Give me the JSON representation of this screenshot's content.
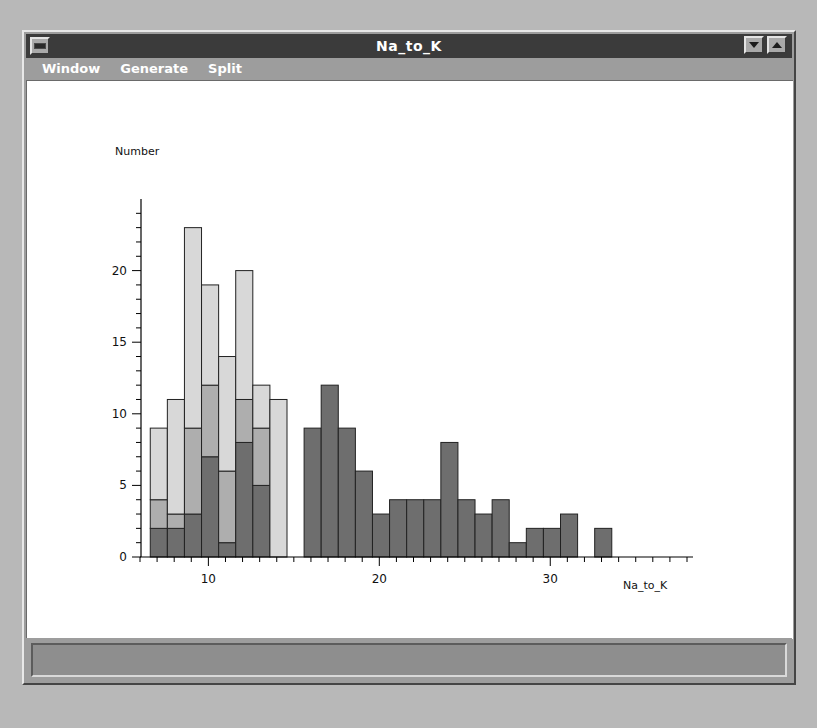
{
  "window": {
    "title": "Na_to_K",
    "controls": {
      "system_menu": "window-menu",
      "minimize": "minimize",
      "maximize": "maximize"
    },
    "menus": [
      "Window",
      "Generate",
      "Split"
    ]
  },
  "colors": {
    "drugB": "#d8d8d8",
    "drugC": "#aeaeae",
    "drugX": "#6e6e6e",
    "outline": "#222222",
    "titlebar": "#3b3b3b",
    "frame": "#9d9d9d",
    "plot_bg": "#ffffff"
  },
  "chart_data": {
    "type": "bar",
    "subtype": "stacked-histogram",
    "title": "",
    "xlabel": "Na_to_K",
    "ylabel": "Number",
    "xlim": [
      6,
      38
    ],
    "ylim": [
      0,
      25
    ],
    "xticks": [
      10,
      20,
      30
    ],
    "yticks": [
      0,
      5,
      10,
      15,
      20
    ],
    "grid": false,
    "legend_position": "bottom",
    "bin_width": 1,
    "legend": [
      "drugB",
      "drugC",
      "drugX"
    ],
    "series": [
      {
        "name": "drugB",
        "values": [
          5,
          8,
          14,
          7,
          8,
          9,
          3,
          11,
          0,
          0,
          0,
          0,
          0,
          0,
          0,
          0,
          0,
          0,
          0,
          0,
          0,
          0,
          0,
          0,
          0,
          0,
          0,
          0,
          0,
          0,
          0,
          0
        ]
      },
      {
        "name": "drugC",
        "values": [
          2,
          1,
          6,
          5,
          5,
          3,
          4,
          0,
          0,
          0,
          0,
          0,
          0,
          0,
          0,
          0,
          0,
          0,
          0,
          0,
          0,
          0,
          0,
          0,
          0,
          0,
          0,
          0,
          0,
          0,
          0,
          0
        ]
      },
      {
        "name": "drugX",
        "values": [
          2,
          2,
          3,
          7,
          1,
          8,
          5,
          0,
          9,
          12,
          9,
          6,
          3,
          4,
          4,
          4,
          8,
          4,
          3,
          4,
          1,
          2,
          2,
          3,
          0,
          2,
          0,
          0,
          0,
          0,
          0,
          0
        ]
      }
    ],
    "bins": [
      {
        "x0": 6.6,
        "drugB": 5,
        "drugC": 2,
        "drugX": 2,
        "total": 9
      },
      {
        "x0": 7.6,
        "drugB": 8,
        "drugC": 1,
        "drugX": 2,
        "total": 11
      },
      {
        "x0": 8.6,
        "drugB": 14,
        "drugC": 6,
        "drugX": 3,
        "total": 23
      },
      {
        "x0": 9.6,
        "drugB": 7,
        "drugC": 5,
        "drugX": 7,
        "total": 24
      },
      {
        "x0": 10.6,
        "drugB": 8,
        "drugC": 5,
        "drugX": 1,
        "total": 14
      },
      {
        "x0": 11.6,
        "drugB": 9,
        "drugC": 3,
        "drugX": 8,
        "total": 20
      },
      {
        "x0": 12.6,
        "drugB": 3,
        "drugC": 4,
        "drugX": 5,
        "total": 12
      },
      {
        "x0": 13.6,
        "drugB": 11,
        "drugC": 0,
        "drugX": 0,
        "total": 11
      },
      {
        "x0": 15.6,
        "drugB": 0,
        "drugC": 0,
        "drugX": 9,
        "total": 9
      },
      {
        "x0": 16.6,
        "drugB": 0,
        "drugC": 0,
        "drugX": 12,
        "total": 12
      },
      {
        "x0": 17.6,
        "drugB": 0,
        "drugC": 0,
        "drugX": 9,
        "total": 9
      },
      {
        "x0": 18.6,
        "drugB": 0,
        "drugC": 0,
        "drugX": 6,
        "total": 6
      },
      {
        "x0": 19.6,
        "drugB": 0,
        "drugC": 0,
        "drugX": 3,
        "total": 3
      },
      {
        "x0": 20.6,
        "drugB": 0,
        "drugC": 0,
        "drugX": 4,
        "total": 4
      },
      {
        "x0": 21.6,
        "drugB": 0,
        "drugC": 0,
        "drugX": 4,
        "total": 4
      },
      {
        "x0": 22.6,
        "drugB": 0,
        "drugC": 0,
        "drugX": 4,
        "total": 4
      },
      {
        "x0": 23.6,
        "drugB": 0,
        "drugC": 0,
        "drugX": 8,
        "total": 8
      },
      {
        "x0": 24.6,
        "drugB": 0,
        "drugC": 0,
        "drugX": 4,
        "total": 4
      },
      {
        "x0": 25.6,
        "drugB": 0,
        "drugC": 0,
        "drugX": 3,
        "total": 3
      },
      {
        "x0": 26.6,
        "drugB": 0,
        "drugC": 0,
        "drugX": 4,
        "total": 4
      },
      {
        "x0": 27.6,
        "drugB": 0,
        "drugC": 0,
        "drugX": 1,
        "total": 1
      },
      {
        "x0": 28.6,
        "drugB": 0,
        "drugC": 0,
        "drugX": 2,
        "total": 2
      },
      {
        "x0": 29.6,
        "drugB": 0,
        "drugC": 0,
        "drugX": 2,
        "total": 2
      },
      {
        "x0": 30.6,
        "drugB": 0,
        "drugC": 0,
        "drugX": 3,
        "total": 3
      },
      {
        "x0": 32.6,
        "drugB": 0,
        "drugC": 0,
        "drugX": 2,
        "total": 2
      }
    ]
  }
}
